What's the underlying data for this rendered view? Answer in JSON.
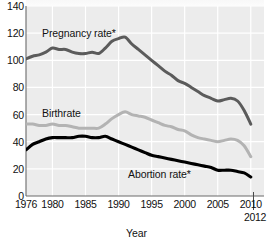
{
  "chart_data": {
    "type": "line",
    "title": "",
    "xlabel": "Year",
    "ylabel": "",
    "xlim": [
      1976,
      2012
    ],
    "ylim": [
      0,
      140
    ],
    "grid": true,
    "legend_position": "inline-annotations",
    "y_ticks": [
      0,
      20,
      40,
      60,
      80,
      100,
      120,
      140
    ],
    "x_ticks": [
      1976,
      1980,
      1985,
      1990,
      1995,
      2000,
      2005,
      2010
    ],
    "x_end_tick": "2012",
    "x": [
      1976,
      1977,
      1978,
      1979,
      1980,
      1981,
      1982,
      1983,
      1984,
      1985,
      1986,
      1987,
      1988,
      1989,
      1990,
      1991,
      1992,
      1993,
      1994,
      1995,
      1996,
      1997,
      1998,
      1999,
      2000,
      2001,
      2002,
      2003,
      2004,
      2005,
      2006,
      2007,
      2008,
      2009,
      2010
    ],
    "series": [
      {
        "name": "Pregnancy rate*",
        "color": "#5b5b5b",
        "values": [
          101,
          103,
          104,
          106,
          109,
          108,
          108,
          106,
          105,
          105,
          106,
          105,
          109,
          114,
          116,
          117,
          112,
          108,
          104,
          100,
          96,
          92,
          89,
          85,
          83,
          80,
          77,
          74,
          72,
          70,
          71,
          72,
          70,
          63,
          53
        ]
      },
      {
        "name": "Birthrate",
        "color": "#b3b3b3",
        "values": [
          53,
          53,
          52,
          52,
          53,
          52,
          52,
          51,
          50,
          50,
          50,
          50,
          53,
          57,
          60,
          62,
          60,
          59,
          58,
          56,
          54,
          52,
          51,
          49,
          48,
          45,
          43,
          42,
          41,
          40,
          41,
          42,
          41,
          37,
          29
        ]
      },
      {
        "name": "Abortion rate*",
        "color": "#000000",
        "values": [
          34,
          38,
          40,
          42,
          43,
          43,
          43,
          43,
          44,
          44,
          43,
          43,
          44,
          42,
          40,
          38,
          36,
          34,
          32,
          30,
          29,
          28,
          27,
          26,
          25,
          24,
          23,
          22,
          21,
          19,
          19,
          19,
          18,
          17,
          14
        ]
      }
    ],
    "annotations": [
      {
        "text": "Pregnancy rate*",
        "series": "Pregnancy rate*"
      },
      {
        "text": "Birthrate",
        "series": "Birthrate"
      },
      {
        "text": "Abortion rate*",
        "series": "Abortion rate*"
      }
    ],
    "colors": {
      "plot_background": "#ececec",
      "gridline": "#ffffff",
      "axis": "#555555",
      "text": "#111111"
    }
  }
}
